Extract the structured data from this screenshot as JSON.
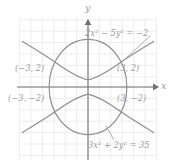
{
  "figure": {
    "type": "math-graph",
    "background": "#ffffff",
    "grid_color": "#eee6e8",
    "curve_color": "#8e8e93",
    "axis_color": "#6f6f74",
    "text_color": "#9a9a9e"
  },
  "axes": {
    "x_label": "x",
    "y_label": "y",
    "origin": [
      88,
      87
    ],
    "unit_px": 11.4,
    "x_range": [
      -6,
      6
    ],
    "y_range": [
      -6,
      6
    ]
  },
  "equations": {
    "hyperbola": {
      "text_parts": [
        "2",
        "x",
        "2",
        " − 5",
        "y",
        "2",
        " = −2"
      ],
      "display": "2x² − 5y² = −2",
      "coef_x2": 2,
      "coef_y2": -5,
      "constant": -2
    },
    "ellipse": {
      "text_parts": [
        "3",
        "x",
        "2",
        " + 2",
        "y",
        "2",
        " = 35"
      ],
      "display": "3x² + 2y² = 35",
      "coef_x2": 3,
      "coef_y2": 2,
      "constant": 35
    }
  },
  "points": [
    {
      "name": "upper-left",
      "display": "(−3, 2)",
      "x": -3,
      "y": 2
    },
    {
      "name": "upper-right",
      "display": "(3, 2)",
      "x": 3,
      "y": 2
    },
    {
      "name": "lower-left",
      "display": "(−3, −2)",
      "x": -3,
      "y": -2
    },
    {
      "name": "lower-right",
      "display": "(3, −2)",
      "x": 3,
      "y": -2
    }
  ]
}
